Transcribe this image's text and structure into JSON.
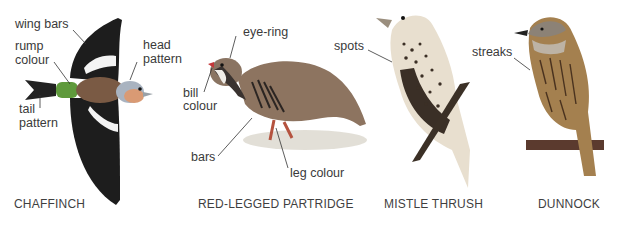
{
  "figure": {
    "caption_top_fragment": "",
    "birds": [
      {
        "name": "CHAFFINCH",
        "labels": [
          "wing bars",
          "rump colour",
          "head pattern",
          "tail pattern"
        ]
      },
      {
        "name": "RED-LEGGED PARTRIDGE",
        "labels": [
          "eye-ring",
          "bill colour",
          "bars",
          "leg colour"
        ]
      },
      {
        "name": "MISTLE THRUSH",
        "labels": [
          "spots"
        ]
      },
      {
        "name": "DUNNOCK",
        "labels": [
          "streaks"
        ]
      }
    ]
  },
  "labels": {
    "wing_bars": "wing bars",
    "rump_1": "rump",
    "rump_2": "colour",
    "head_1": "head",
    "head_2": "pattern",
    "tail_1": "tail",
    "tail_2": "pattern",
    "eye_ring": "eye-ring",
    "bill_1": "bill",
    "bill_2": "colour",
    "bars": "bars",
    "leg_colour": "leg colour",
    "spots": "spots",
    "streaks": "streaks"
  },
  "names": {
    "chaffinch": "CHAFFINCH",
    "partridge": "RED-LEGGED PARTRIDGE",
    "thrush": "MISTLE THRUSH",
    "dunnock": "DUNNOCK"
  },
  "colors": {
    "text": "#3a3a3a",
    "background": "#ffffff"
  }
}
